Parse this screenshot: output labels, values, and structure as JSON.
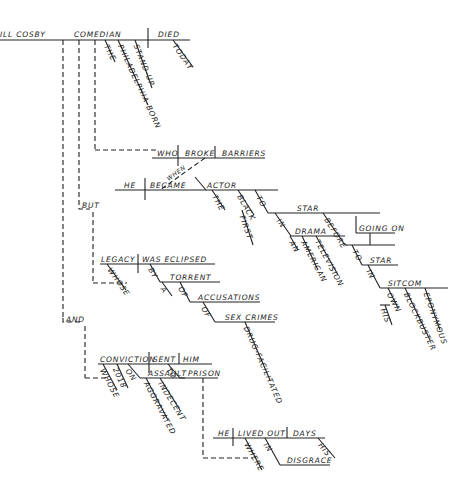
{
  "diagram": {
    "type": "sentence-diagram",
    "main": {
      "subject": "ILL COSBY",
      "appositive": "COMEDIAN",
      "verb": "DIED",
      "modifiers_subject": [
        "THE",
        "PHILADELPHIA-BORN",
        "STAND-UP"
      ],
      "modifiers_verb": [
        "TODAY"
      ]
    },
    "clause1": {
      "subject": "WHO",
      "verb": "BROKE",
      "object": "BARRIERS",
      "connector": "WHEN"
    },
    "clause2": {
      "subject": "HE",
      "verb": "BECAME",
      "object": "ACTOR",
      "modifiers": [
        "THE",
        "BLACK",
        "FIRST",
        "TO",
        "STAR",
        "IN",
        "DRAMA",
        "AN",
        "AMERICAN",
        "TELEVISION",
        "BEFORE",
        "GOING ON",
        "TO",
        "STAR",
        "IN",
        "SITCOM",
        "OWN",
        "HIS",
        "BLOCKBUSTER",
        "EPONYMOUS"
      ]
    },
    "conj_but": "BUT",
    "clause3": {
      "subject": "LEGACY",
      "verb": "WAS ECLIPSED",
      "modifiers": [
        "WHOSE",
        "BY",
        "TORRENT",
        "A",
        "OF",
        "ACCUSATIONS",
        "OF",
        "SEX CRIMES",
        "DRUG-FACILITATED"
      ]
    },
    "conj_and": "AND",
    "clause4": {
      "subject": "CONVICTION",
      "verb": "SENT",
      "object": "HIM",
      "modifiers": [
        "WHOSE",
        "2018",
        "ON",
        "ASSAULT",
        "AGGRAVATED",
        "INDECENT",
        "TO",
        "PRISON"
      ]
    },
    "clause5": {
      "subject": "HE",
      "verb": "LIVED OUT",
      "object": "DAYS",
      "modifiers": [
        "WHERE",
        "IN",
        "DISGRACE",
        "HIS"
      ]
    }
  }
}
